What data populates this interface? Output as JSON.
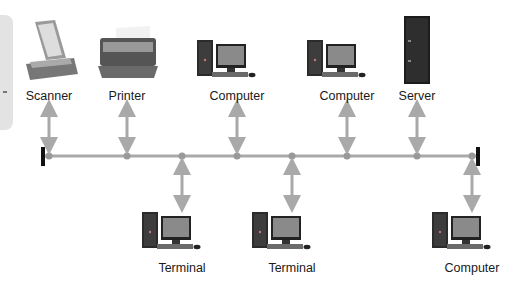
{
  "diagram": {
    "type": "bus-topology",
    "bus_color": "#a9a9a9",
    "terminator_color": "#111111",
    "top_devices": [
      {
        "label": "Scanner",
        "icon": "scanner-icon",
        "x": 49
      },
      {
        "label": "Printer",
        "icon": "printer-icon",
        "x": 127
      },
      {
        "label": "Computer",
        "icon": "computer-icon",
        "x": 237
      },
      {
        "label": "Computer",
        "icon": "computer-icon",
        "x": 347
      },
      {
        "label": "Server",
        "icon": "server-icon",
        "x": 417
      }
    ],
    "bottom_devices": [
      {
        "label": "Terminal",
        "icon": "computer-icon",
        "x": 182
      },
      {
        "label": "Terminal",
        "icon": "computer-icon",
        "x": 292
      },
      {
        "label": "Computer",
        "icon": "computer-icon",
        "x": 472
      }
    ]
  }
}
